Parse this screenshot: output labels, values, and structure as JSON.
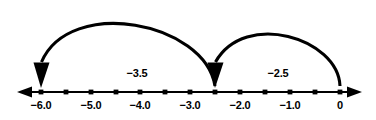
{
  "diagram": {
    "colors": {
      "line": "#000000",
      "arc": "#000000",
      "text": "#000000",
      "background": "#ffffff"
    },
    "axis": {
      "y_pixel": 92,
      "x_start_pixel": 17,
      "x_end_pixel": 362,
      "unit_pixels": 49.8,
      "origin_pixel": 340,
      "min_value": -6.5,
      "max_value": 0.5,
      "left_arrow": "axis-arrow-left",
      "right_arrow": "axis-arrow-right"
    },
    "ticks": [
      {
        "value": -6.0,
        "x": 41,
        "label": "−6.0",
        "labeled": true
      },
      {
        "value": -5.5,
        "x": 66,
        "label": "",
        "labeled": false
      },
      {
        "value": -5.0,
        "x": 91,
        "label": "−5.0",
        "labeled": true
      },
      {
        "value": -4.5,
        "x": 116,
        "label": "",
        "labeled": false
      },
      {
        "value": -4.0,
        "x": 140,
        "label": "−4.0",
        "labeled": true
      },
      {
        "value": -3.5,
        "x": 165,
        "label": "",
        "labeled": false
      },
      {
        "value": -3.0,
        "x": 190,
        "label": "−3.0",
        "labeled": true
      },
      {
        "value": -2.5,
        "x": 215,
        "label": "",
        "labeled": false
      },
      {
        "value": -2.0,
        "x": 240,
        "label": "−2.0",
        "labeled": true
      },
      {
        "value": -1.5,
        "x": 265,
        "label": "",
        "labeled": false
      },
      {
        "value": -1.0,
        "x": 290,
        "label": "−1.0",
        "labeled": true
      },
      {
        "value": -0.5,
        "x": 315,
        "label": "",
        "labeled": false
      },
      {
        "value": 0.0,
        "x": 340,
        "label": "0",
        "labeled": true
      }
    ],
    "jumps": [
      {
        "name": "jump-minus-2point5",
        "label": "−2.5",
        "from_value": 0.0,
        "to_value": -2.5,
        "from_x": 340,
        "to_x": 215,
        "apex_y": 28,
        "label_x": 278,
        "label_y": 73,
        "direction": "left"
      },
      {
        "name": "jump-minus-3point5",
        "label": "−3.5",
        "from_value": -2.5,
        "to_value": -6.0,
        "from_x": 215,
        "to_x": 41,
        "apex_y": 11,
        "label_x": 137,
        "label_y": 73,
        "direction": "left"
      }
    ]
  }
}
